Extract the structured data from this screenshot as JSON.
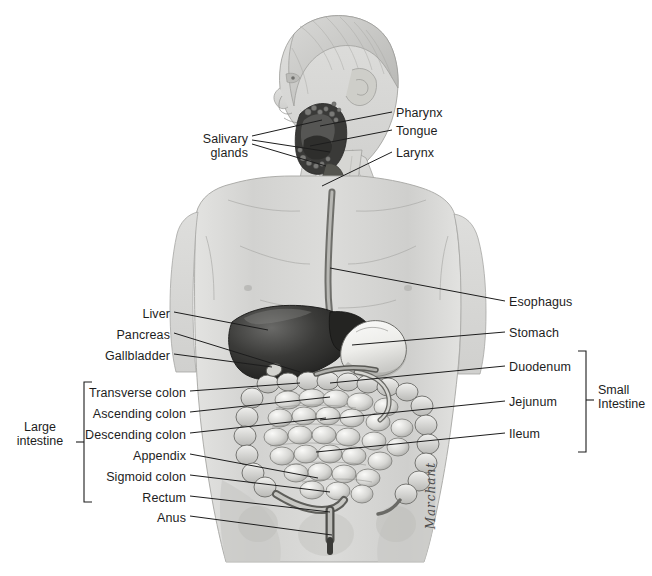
{
  "figure": {
    "signature": "Marchant",
    "background": "#ffffff",
    "ink": "#1d1d1d"
  },
  "labels_left": [
    {
      "text": "Salivary\nglands",
      "x": 248,
      "y": 139,
      "tip_x": 330,
      "tip_y": 143,
      "multiline": true
    },
    {
      "text": "Liver",
      "x": 170,
      "y": 307,
      "tip_x": 268,
      "tip_y": 330
    },
    {
      "text": "Pancreas",
      "x": 170,
      "y": 328,
      "tip_x": 300,
      "tip_y": 372
    },
    {
      "text": "Gallbladder",
      "x": 170,
      "y": 349,
      "tip_x": 272,
      "tip_y": 367
    },
    {
      "text": "Transverse colon",
      "x": 186,
      "y": 386,
      "tip_x": 300,
      "tip_y": 383
    },
    {
      "text": "Ascending colon",
      "x": 186,
      "y": 407,
      "tip_x": 330,
      "tip_y": 397
    },
    {
      "text": "Descending colon",
      "x": 186,
      "y": 428,
      "tip_x": 326,
      "tip_y": 418
    },
    {
      "text": "Appendix",
      "x": 186,
      "y": 449,
      "tip_x": 318,
      "tip_y": 478
    },
    {
      "text": "Sigmoid colon",
      "x": 186,
      "y": 470,
      "tip_x": 330,
      "tip_y": 492
    },
    {
      "text": "Rectum",
      "x": 186,
      "y": 491,
      "tip_x": 330,
      "tip_y": 512
    },
    {
      "text": "Anus",
      "x": 186,
      "y": 511,
      "tip_x": 332,
      "tip_y": 535
    }
  ],
  "labels_right": [
    {
      "text": "Pharynx",
      "x": 396,
      "y": 107,
      "tip_x": 320,
      "tip_y": 126
    },
    {
      "text": "Tongue",
      "x": 396,
      "y": 125,
      "tip_x": 310,
      "tip_y": 146
    },
    {
      "text": "Larynx",
      "x": 396,
      "y": 147,
      "tip_x": 322,
      "tip_y": 186
    },
    {
      "text": "Esophagus",
      "x": 509,
      "y": 296,
      "tip_x": 330,
      "tip_y": 268
    },
    {
      "text": "Stomach",
      "x": 509,
      "y": 327,
      "tip_x": 352,
      "tip_y": 345
    },
    {
      "text": "Duodenum",
      "x": 509,
      "y": 361,
      "tip_x": 330,
      "tip_y": 383
    },
    {
      "text": "Jejunum",
      "x": 509,
      "y": 396,
      "tip_x": 320,
      "tip_y": 420
    },
    {
      "text": "Ileum",
      "x": 509,
      "y": 428,
      "tip_x": 316,
      "tip_y": 452
    }
  ],
  "group_brackets": [
    {
      "name": "large-intestine",
      "text": "Large\nintestine",
      "label_x": 28,
      "label_y": 425,
      "spine_x": 84,
      "top_y": 382,
      "bottom_y": 502,
      "tick_y": 442,
      "side": "left"
    },
    {
      "name": "small-intestine",
      "text": "Small\nIntestine",
      "label_x": 598,
      "label_y": 388,
      "spine_x": 586,
      "top_y": 351,
      "bottom_y": 452,
      "tick_y": 400,
      "side": "right"
    }
  ],
  "organs": [
    {
      "name": "liver",
      "tone": "dark"
    },
    {
      "name": "stomach",
      "tone": "light"
    },
    {
      "name": "small-intestine",
      "tone": "mid"
    },
    {
      "name": "large-intestine",
      "tone": "mid"
    },
    {
      "name": "esophagus",
      "tone": "mid"
    },
    {
      "name": "oral-cavity",
      "tone": "dark"
    }
  ]
}
